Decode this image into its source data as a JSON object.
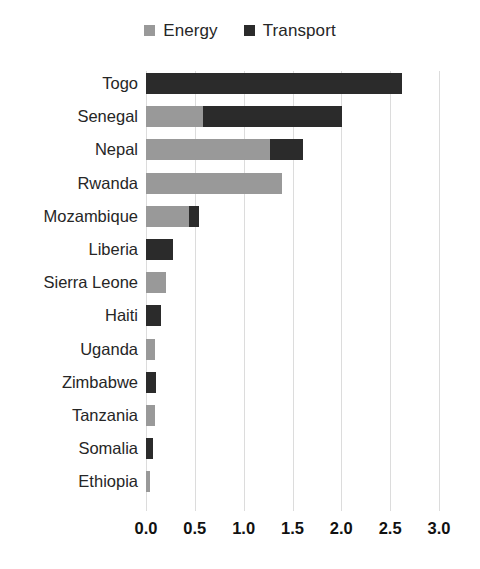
{
  "chart_data": {
    "type": "bar",
    "orientation": "horizontal",
    "stacked": true,
    "title": "",
    "subtitle": "",
    "xlabel": "",
    "ylabel": "",
    "xlim": [
      0.0,
      3.0
    ],
    "xticks": [
      "0.0",
      "0.5",
      "1.0",
      "1.5",
      "2.0",
      "2.5",
      "3.0"
    ],
    "xtick_values": [
      0.0,
      0.5,
      1.0,
      1.5,
      2.0,
      2.5,
      3.0
    ],
    "grid": "vertical",
    "legend_position": "top-center",
    "categories": [
      "Togo",
      "Senegal",
      "Nepal",
      "Rwanda",
      "Mozambique",
      "Liberia",
      "Sierra Leone",
      "Haiti",
      "Uganda",
      "Zimbabwe",
      "Tanzania",
      "Somalia",
      "Ethiopia"
    ],
    "series": [
      {
        "name": "Energy",
        "color": "#999999",
        "values": [
          0.0,
          0.58,
          1.27,
          1.39,
          0.44,
          0.0,
          0.2,
          0.0,
          0.09,
          0.0,
          0.09,
          0.0,
          0.04
        ]
      },
      {
        "name": "Transport",
        "color": "#2b2b2b",
        "values": [
          2.62,
          1.43,
          0.34,
          0.0,
          0.1,
          0.28,
          0.0,
          0.15,
          0.0,
          0.1,
          0.0,
          0.07,
          0.0
        ]
      }
    ],
    "totals": [
      2.62,
      2.01,
      1.61,
      1.39,
      0.54,
      0.28,
      0.2,
      0.15,
      0.09,
      0.1,
      0.09,
      0.07,
      0.04
    ]
  },
  "legend": {
    "entries": [
      {
        "label": "Energy",
        "color": "#999999",
        "swatch_name": "legend-swatch-energy"
      },
      {
        "label": "Transport",
        "color": "#2b2b2b",
        "swatch_name": "legend-swatch-transport"
      }
    ]
  },
  "colors": {
    "energy": "#999999",
    "transport": "#2b2b2b",
    "gridline": "#dcdcdc",
    "text": "#262626",
    "background": "#ffffff"
  }
}
